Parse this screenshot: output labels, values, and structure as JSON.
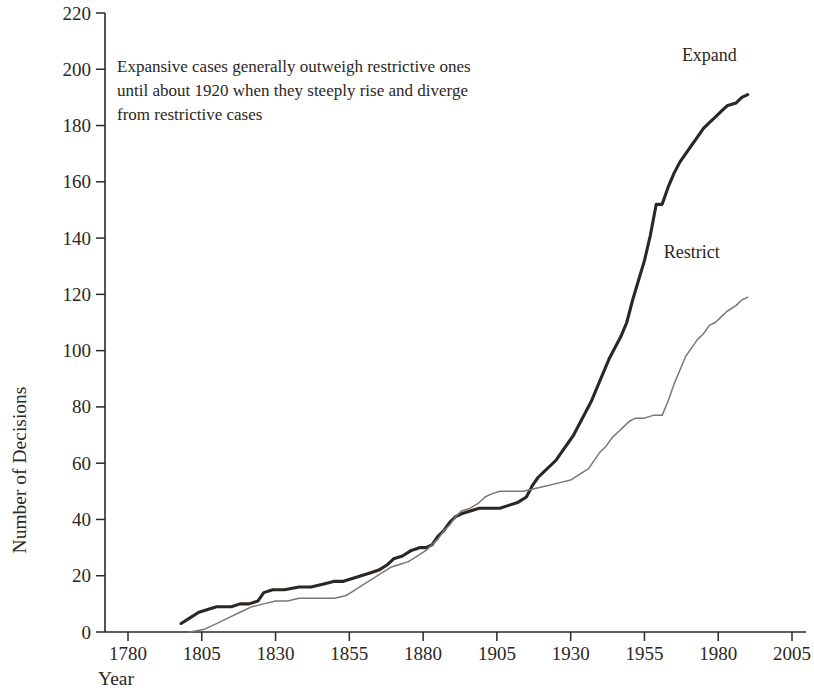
{
  "chart_data": {
    "type": "line",
    "title": "",
    "xlabel": "Year",
    "ylabel": "Number of Decisions",
    "xlim": [
      1770,
      2008
    ],
    "ylim": [
      0,
      220
    ],
    "xticks": [
      1780,
      1805,
      1830,
      1855,
      1880,
      1905,
      1930,
      1955,
      1980,
      2005
    ],
    "yticks": [
      0,
      20,
      40,
      60,
      80,
      100,
      120,
      140,
      160,
      180,
      200,
      220
    ],
    "grid": false,
    "legend_position": "inline-end-labels",
    "annotations": [
      {
        "name": "chart-annotation",
        "lines": [
          "Expansive cases generally outweigh restrictive ones",
          "until about 1920 when they steeply rise and diverge",
          "from restrictive cases"
        ]
      }
    ],
    "series": [
      {
        "name": "Expand",
        "label": "Expand",
        "color": "#2b2724",
        "width": 3.1,
        "points": [
          [
            1798,
            3
          ],
          [
            1801,
            5
          ],
          [
            1804,
            7
          ],
          [
            1807,
            8
          ],
          [
            1810,
            9
          ],
          [
            1815,
            9
          ],
          [
            1818,
            10
          ],
          [
            1821,
            10
          ],
          [
            1824,
            11
          ],
          [
            1826,
            14
          ],
          [
            1829,
            15
          ],
          [
            1833,
            15
          ],
          [
            1838,
            16
          ],
          [
            1842,
            16
          ],
          [
            1846,
            17
          ],
          [
            1850,
            18
          ],
          [
            1853,
            18
          ],
          [
            1856,
            19
          ],
          [
            1859,
            20
          ],
          [
            1862,
            21
          ],
          [
            1865,
            22
          ],
          [
            1868,
            24
          ],
          [
            1870,
            26
          ],
          [
            1873,
            27
          ],
          [
            1876,
            29
          ],
          [
            1879,
            30
          ],
          [
            1881,
            30
          ],
          [
            1883,
            31
          ],
          [
            1885,
            34
          ],
          [
            1887,
            36
          ],
          [
            1889,
            39
          ],
          [
            1891,
            41
          ],
          [
            1893,
            42
          ],
          [
            1896,
            43
          ],
          [
            1899,
            44
          ],
          [
            1902,
            44
          ],
          [
            1906,
            44
          ],
          [
            1909,
            45
          ],
          [
            1912,
            46
          ],
          [
            1915,
            48
          ],
          [
            1917,
            52
          ],
          [
            1919,
            55
          ],
          [
            1921,
            57
          ],
          [
            1923,
            59
          ],
          [
            1925,
            61
          ],
          [
            1927,
            64
          ],
          [
            1929,
            67
          ],
          [
            1931,
            70
          ],
          [
            1933,
            74
          ],
          [
            1935,
            78
          ],
          [
            1937,
            82
          ],
          [
            1939,
            87
          ],
          [
            1941,
            92
          ],
          [
            1943,
            97
          ],
          [
            1945,
            101
          ],
          [
            1947,
            105
          ],
          [
            1949,
            110
          ],
          [
            1951,
            118
          ],
          [
            1953,
            125
          ],
          [
            1955,
            132
          ],
          [
            1957,
            141
          ],
          [
            1959,
            152
          ],
          [
            1961,
            152
          ],
          [
            1963,
            158
          ],
          [
            1965,
            163
          ],
          [
            1967,
            167
          ],
          [
            1969,
            170
          ],
          [
            1971,
            173
          ],
          [
            1973,
            176
          ],
          [
            1975,
            179
          ],
          [
            1977,
            181
          ],
          [
            1979,
            183
          ],
          [
            1981,
            185
          ],
          [
            1983,
            187
          ],
          [
            1986,
            188
          ],
          [
            1988,
            190
          ],
          [
            1990,
            191
          ]
        ]
      },
      {
        "name": "Restrict",
        "label": "Restrict",
        "color": "#7a7673",
        "width": 1.5,
        "points": [
          [
            1801,
            0
          ],
          [
            1806,
            1
          ],
          [
            1810,
            3
          ],
          [
            1814,
            5
          ],
          [
            1818,
            7
          ],
          [
            1822,
            9
          ],
          [
            1826,
            10
          ],
          [
            1830,
            11
          ],
          [
            1834,
            11
          ],
          [
            1838,
            12
          ],
          [
            1842,
            12
          ],
          [
            1846,
            12
          ],
          [
            1850,
            12
          ],
          [
            1854,
            13
          ],
          [
            1857,
            15
          ],
          [
            1860,
            17
          ],
          [
            1863,
            19
          ],
          [
            1866,
            21
          ],
          [
            1869,
            23
          ],
          [
            1872,
            24
          ],
          [
            1875,
            25
          ],
          [
            1878,
            27
          ],
          [
            1881,
            29
          ],
          [
            1883,
            31
          ],
          [
            1885,
            33
          ],
          [
            1887,
            36
          ],
          [
            1889,
            38
          ],
          [
            1891,
            41
          ],
          [
            1893,
            43
          ],
          [
            1896,
            44
          ],
          [
            1899,
            46
          ],
          [
            1901,
            48
          ],
          [
            1903,
            49
          ],
          [
            1906,
            50
          ],
          [
            1910,
            50
          ],
          [
            1914,
            50
          ],
          [
            1918,
            51
          ],
          [
            1922,
            52
          ],
          [
            1926,
            53
          ],
          [
            1930,
            54
          ],
          [
            1933,
            56
          ],
          [
            1936,
            58
          ],
          [
            1938,
            61
          ],
          [
            1940,
            64
          ],
          [
            1942,
            66
          ],
          [
            1944,
            69
          ],
          [
            1946,
            71
          ],
          [
            1948,
            73
          ],
          [
            1950,
            75
          ],
          [
            1952,
            76
          ],
          [
            1955,
            76
          ],
          [
            1958,
            77
          ],
          [
            1961,
            77
          ],
          [
            1963,
            82
          ],
          [
            1965,
            88
          ],
          [
            1967,
            93
          ],
          [
            1969,
            98
          ],
          [
            1971,
            101
          ],
          [
            1973,
            104
          ],
          [
            1975,
            106
          ],
          [
            1977,
            109
          ],
          [
            1979,
            110
          ],
          [
            1981,
            112
          ],
          [
            1983,
            114
          ],
          [
            1986,
            116
          ],
          [
            1988,
            118
          ],
          [
            1990,
            119
          ]
        ]
      }
    ],
    "series_label_positions": [
      {
        "name": "Expand",
        "x": 1977,
        "y": 203
      },
      {
        "name": "Restrict",
        "x": 1971,
        "y": 133
      }
    ]
  }
}
